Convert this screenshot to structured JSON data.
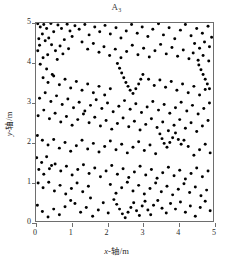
{
  "figure": {
    "title_main": "A",
    "title_sub": "3",
    "x_axis_label": "x-轴/m",
    "y_axis_label": "y-轴/m"
  },
  "chart_data": {
    "type": "scatter",
    "xlabel": "x-轴/m",
    "ylabel": "y-轴/m",
    "xlim": [
      0,
      5
    ],
    "ylim": [
      0,
      5
    ],
    "xticks": [
      0,
      1,
      2,
      3,
      4,
      5
    ],
    "yticks": [
      0,
      1,
      2,
      3,
      4,
      5
    ],
    "grid": false,
    "legend": null,
    "marker": {
      "shape": "circle",
      "color": "#000000",
      "size_px": 3
    },
    "n_points": 300,
    "points": [
      [
        0.05,
        4.98
      ],
      [
        0.12,
        4.9
      ],
      [
        0.22,
        4.96
      ],
      [
        0.18,
        4.72
      ],
      [
        0.08,
        4.6
      ],
      [
        0.3,
        4.86
      ],
      [
        0.42,
        4.99
      ],
      [
        0.1,
        4.44
      ],
      [
        0.26,
        4.55
      ],
      [
        0.05,
        4.3
      ],
      [
        0.36,
        4.62
      ],
      [
        0.5,
        4.78
      ],
      [
        0.62,
        4.95
      ],
      [
        0.72,
        4.86
      ],
      [
        0.88,
        4.97
      ],
      [
        0.96,
        4.8
      ],
      [
        1.1,
        4.93
      ],
      [
        1.02,
        4.66
      ],
      [
        0.8,
        4.58
      ],
      [
        0.68,
        4.42
      ],
      [
        0.55,
        4.3
      ],
      [
        0.44,
        4.45
      ],
      [
        0.33,
        4.2
      ],
      [
        0.2,
        4.12
      ],
      [
        0.12,
        3.96
      ],
      [
        0.3,
        3.84
      ],
      [
        0.46,
        3.7
      ],
      [
        0.6,
        4.08
      ],
      [
        0.76,
        4.22
      ],
      [
        0.92,
        4.35
      ],
      [
        1.22,
        4.84
      ],
      [
        1.38,
        4.96
      ],
      [
        1.5,
        4.7
      ],
      [
        1.66,
        4.9
      ],
      [
        1.8,
        4.78
      ],
      [
        1.95,
        4.94
      ],
      [
        2.1,
        4.72
      ],
      [
        2.26,
        4.88
      ],
      [
        2.4,
        4.62
      ],
      [
        2.55,
        4.8
      ],
      [
        2.7,
        4.96
      ],
      [
        2.86,
        4.74
      ],
      [
        3.0,
        4.9
      ],
      [
        3.16,
        4.66
      ],
      [
        3.3,
        4.84
      ],
      [
        3.46,
        4.98
      ],
      [
        3.6,
        4.7
      ],
      [
        3.76,
        4.88
      ],
      [
        3.92,
        4.6
      ],
      [
        4.08,
        4.82
      ],
      [
        4.22,
        4.96
      ],
      [
        4.38,
        4.68
      ],
      [
        4.54,
        4.86
      ],
      [
        4.7,
        4.74
      ],
      [
        4.86,
        4.92
      ],
      [
        4.96,
        4.64
      ],
      [
        4.9,
        4.4
      ],
      [
        4.76,
        4.52
      ],
      [
        4.62,
        4.36
      ],
      [
        4.48,
        4.48
      ],
      [
        1.3,
        4.52
      ],
      [
        1.46,
        4.34
      ],
      [
        1.62,
        4.48
      ],
      [
        1.78,
        4.26
      ],
      [
        1.92,
        4.4
      ],
      [
        2.08,
        4.18
      ],
      [
        2.24,
        4.34
      ],
      [
        2.4,
        4.12
      ],
      [
        2.56,
        4.28
      ],
      [
        2.72,
        4.44
      ],
      [
        2.88,
        4.2
      ],
      [
        3.04,
        4.36
      ],
      [
        3.2,
        4.14
      ],
      [
        3.36,
        4.3
      ],
      [
        3.52,
        4.46
      ],
      [
        3.68,
        4.22
      ],
      [
        3.84,
        4.38
      ],
      [
        4.0,
        4.16
      ],
      [
        4.16,
        4.32
      ],
      [
        4.32,
        4.1
      ],
      [
        4.44,
        4.24
      ],
      [
        4.58,
        4.06
      ],
      [
        4.72,
        4.18
      ],
      [
        4.88,
        4.04
      ],
      [
        2.3,
        3.98
      ],
      [
        2.36,
        3.86
      ],
      [
        2.42,
        3.74
      ],
      [
        2.48,
        3.62
      ],
      [
        2.54,
        3.5
      ],
      [
        2.6,
        3.4
      ],
      [
        2.66,
        3.3
      ],
      [
        2.74,
        3.22
      ],
      [
        2.82,
        3.34
      ],
      [
        2.9,
        3.46
      ],
      [
        2.96,
        3.58
      ],
      [
        3.02,
        3.7
      ],
      [
        4.6,
        3.94
      ],
      [
        4.66,
        3.82
      ],
      [
        4.72,
        3.7
      ],
      [
        4.78,
        3.58
      ],
      [
        4.84,
        3.46
      ],
      [
        4.9,
        3.34
      ],
      [
        0.2,
        3.62
      ],
      [
        0.34,
        3.5
      ],
      [
        0.5,
        3.66
      ],
      [
        0.66,
        3.44
      ],
      [
        0.82,
        3.58
      ],
      [
        0.98,
        3.36
      ],
      [
        1.14,
        3.52
      ],
      [
        1.3,
        3.3
      ],
      [
        1.46,
        3.46
      ],
      [
        1.62,
        3.24
      ],
      [
        1.78,
        3.4
      ],
      [
        1.94,
        3.18
      ],
      [
        2.1,
        3.34
      ],
      [
        3.18,
        3.58
      ],
      [
        3.34,
        3.42
      ],
      [
        3.5,
        3.56
      ],
      [
        3.66,
        3.38
      ],
      [
        3.82,
        3.52
      ],
      [
        3.98,
        3.3
      ],
      [
        4.14,
        3.46
      ],
      [
        4.3,
        3.24
      ],
      [
        4.46,
        3.4
      ],
      [
        4.62,
        3.18
      ],
      [
        4.78,
        3.32
      ],
      [
        0.1,
        3.1
      ],
      [
        0.26,
        3.24
      ],
      [
        0.42,
        3.02
      ],
      [
        0.58,
        3.16
      ],
      [
        0.74,
        2.94
      ],
      [
        0.9,
        3.08
      ],
      [
        1.06,
        2.86
      ],
      [
        1.22,
        3.0
      ],
      [
        1.38,
        2.78
      ],
      [
        1.54,
        2.92
      ],
      [
        1.7,
        3.06
      ],
      [
        1.86,
        2.84
      ],
      [
        2.02,
        2.98
      ],
      [
        2.18,
        2.76
      ],
      [
        2.34,
        2.9
      ],
      [
        2.5,
        3.04
      ],
      [
        2.66,
        2.82
      ],
      [
        2.82,
        2.96
      ],
      [
        2.98,
        2.74
      ],
      [
        3.14,
        2.88
      ],
      [
        3.3,
        3.02
      ],
      [
        3.46,
        2.8
      ],
      [
        3.62,
        2.94
      ],
      [
        3.78,
        2.72
      ],
      [
        3.94,
        2.86
      ],
      [
        4.1,
        3.0
      ],
      [
        4.26,
        2.78
      ],
      [
        4.42,
        2.92
      ],
      [
        4.58,
        2.7
      ],
      [
        4.74,
        2.84
      ],
      [
        4.9,
        2.98
      ],
      [
        0.06,
        2.66
      ],
      [
        0.22,
        2.8
      ],
      [
        0.38,
        2.58
      ],
      [
        0.54,
        2.72
      ],
      [
        0.7,
        2.5
      ],
      [
        0.86,
        2.64
      ],
      [
        1.02,
        2.42
      ],
      [
        1.18,
        2.56
      ],
      [
        1.34,
        2.7
      ],
      [
        1.5,
        2.48
      ],
      [
        1.66,
        2.62
      ],
      [
        1.82,
        2.4
      ],
      [
        1.98,
        2.54
      ],
      [
        2.14,
        2.32
      ],
      [
        2.3,
        2.46
      ],
      [
        2.46,
        2.6
      ],
      [
        2.62,
        2.38
      ],
      [
        2.78,
        2.52
      ],
      [
        2.94,
        2.3
      ],
      [
        3.1,
        2.44
      ],
      [
        3.26,
        2.58
      ],
      [
        3.42,
        2.36
      ],
      [
        3.58,
        2.5
      ],
      [
        3.74,
        2.28
      ],
      [
        3.9,
        2.42
      ],
      [
        4.06,
        2.56
      ],
      [
        4.22,
        2.34
      ],
      [
        4.38,
        2.48
      ],
      [
        4.54,
        2.26
      ],
      [
        4.7,
        2.4
      ],
      [
        4.86,
        2.54
      ],
      [
        3.5,
        2.2
      ],
      [
        3.56,
        2.08
      ],
      [
        3.62,
        1.96
      ],
      [
        3.7,
        1.86
      ],
      [
        3.78,
        1.98
      ],
      [
        3.86,
        2.1
      ],
      [
        3.94,
        2.22
      ],
      [
        4.02,
        2.06
      ],
      [
        4.1,
        1.94
      ],
      [
        4.18,
        2.04
      ],
      [
        0.04,
        2.16
      ],
      [
        0.18,
        2.04
      ],
      [
        0.34,
        1.92
      ],
      [
        0.5,
        2.06
      ],
      [
        0.66,
        1.84
      ],
      [
        0.82,
        1.98
      ],
      [
        0.98,
        1.76
      ],
      [
        1.14,
        1.9
      ],
      [
        1.3,
        2.04
      ],
      [
        1.46,
        1.82
      ],
      [
        1.62,
        1.96
      ],
      [
        1.78,
        1.74
      ],
      [
        1.94,
        1.88
      ],
      [
        2.1,
        2.02
      ],
      [
        2.26,
        1.8
      ],
      [
        2.42,
        1.94
      ],
      [
        2.58,
        1.72
      ],
      [
        2.74,
        1.86
      ],
      [
        2.9,
        2.0
      ],
      [
        3.06,
        1.78
      ],
      [
        3.22,
        1.92
      ],
      [
        3.38,
        1.7
      ],
      [
        4.3,
        1.88
      ],
      [
        4.46,
        1.66
      ],
      [
        4.62,
        1.8
      ],
      [
        4.78,
        1.94
      ],
      [
        4.92,
        1.72
      ],
      [
        0.02,
        1.6
      ],
      [
        0.16,
        1.48
      ],
      [
        0.3,
        1.62
      ],
      [
        0.44,
        1.4
      ],
      [
        0.08,
        1.3
      ],
      [
        0.22,
        1.18
      ],
      [
        0.38,
        1.32
      ],
      [
        0.54,
        1.44
      ],
      [
        0.7,
        1.26
      ],
      [
        0.86,
        1.38
      ],
      [
        1.02,
        1.16
      ],
      [
        1.18,
        1.3
      ],
      [
        1.34,
        1.42
      ],
      [
        1.5,
        1.2
      ],
      [
        1.66,
        1.34
      ],
      [
        1.82,
        1.12
      ],
      [
        1.98,
        1.26
      ],
      [
        2.14,
        1.4
      ],
      [
        2.3,
        1.18
      ],
      [
        2.46,
        1.32
      ],
      [
        2.62,
        1.1
      ],
      [
        2.78,
        1.24
      ],
      [
        2.94,
        1.38
      ],
      [
        3.1,
        1.16
      ],
      [
        3.26,
        1.3
      ],
      [
        3.42,
        1.08
      ],
      [
        3.58,
        1.22
      ],
      [
        3.74,
        1.36
      ],
      [
        3.9,
        1.14
      ],
      [
        4.06,
        1.28
      ],
      [
        4.22,
        1.06
      ],
      [
        4.38,
        1.2
      ],
      [
        4.54,
        1.34
      ],
      [
        4.7,
        1.12
      ],
      [
        4.86,
        1.26
      ],
      [
        0.06,
        0.96
      ],
      [
        0.2,
        0.84
      ],
      [
        0.36,
        0.98
      ],
      [
        0.52,
        0.76
      ],
      [
        0.68,
        0.9
      ],
      [
        0.84,
        0.68
      ],
      [
        1.0,
        0.82
      ],
      [
        1.16,
        0.96
      ],
      [
        1.32,
        0.74
      ],
      [
        1.48,
        0.88
      ],
      [
        2.1,
        0.92
      ],
      [
        2.26,
        0.7
      ],
      [
        2.42,
        0.84
      ],
      [
        2.58,
        0.98
      ],
      [
        2.74,
        0.76
      ],
      [
        2.9,
        0.9
      ],
      [
        3.06,
        0.68
      ],
      [
        3.22,
        0.82
      ],
      [
        3.38,
        0.96
      ],
      [
        3.54,
        0.74
      ],
      [
        3.7,
        0.88
      ],
      [
        3.86,
        0.66
      ],
      [
        4.02,
        0.8
      ],
      [
        4.18,
        0.94
      ],
      [
        4.34,
        0.72
      ],
      [
        4.5,
        0.86
      ],
      [
        4.66,
        0.64
      ],
      [
        4.82,
        0.78
      ],
      [
        2.2,
        0.54
      ],
      [
        2.28,
        0.42
      ],
      [
        2.36,
        0.3
      ],
      [
        2.44,
        0.18
      ],
      [
        2.52,
        0.08
      ],
      [
        2.6,
        0.22
      ],
      [
        2.68,
        0.34
      ],
      [
        2.76,
        0.46
      ],
      [
        2.84,
        0.26
      ],
      [
        2.92,
        0.14
      ],
      [
        3.0,
        0.38
      ],
      [
        3.08,
        0.5
      ],
      [
        3.16,
        0.28
      ],
      [
        3.24,
        0.16
      ],
      [
        3.32,
        0.4
      ],
      [
        3.44,
        0.52
      ],
      [
        3.56,
        0.32
      ],
      [
        3.68,
        0.2
      ],
      [
        3.8,
        0.44
      ],
      [
        3.94,
        0.3
      ],
      [
        4.08,
        0.48
      ],
      [
        4.22,
        0.22
      ],
      [
        4.36,
        0.38
      ],
      [
        4.5,
        0.12
      ],
      [
        4.64,
        0.34
      ],
      [
        4.78,
        0.5
      ],
      [
        4.92,
        0.26
      ],
      [
        0.04,
        0.4
      ],
      [
        0.18,
        0.24
      ],
      [
        0.34,
        0.1
      ],
      [
        0.5,
        0.3
      ],
      [
        0.66,
        0.16
      ],
      [
        0.82,
        0.36
      ],
      [
        1.1,
        0.44
      ],
      [
        1.26,
        0.22
      ],
      [
        1.42,
        0.34
      ],
      [
        1.6,
        0.12
      ],
      [
        1.76,
        0.28
      ],
      [
        1.9,
        0.46
      ],
      [
        2.04,
        0.2
      ],
      [
        0.98,
        0.52
      ],
      [
        1.54,
        0.58
      ]
    ]
  }
}
